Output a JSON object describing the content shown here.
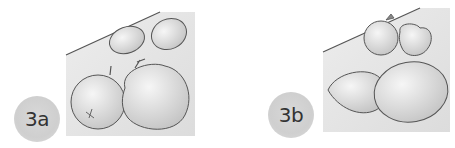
{
  "figures": [
    {
      "label": "3a",
      "description": "Two lemons behind two apples on a table",
      "items": [
        "lemon",
        "lemon",
        "apple",
        "apple"
      ]
    },
    {
      "label": "3b",
      "description": "Two small fruits (apple and peach) behind two lemons on a table",
      "items": [
        "apple",
        "peach",
        "lemon",
        "lemon"
      ]
    }
  ],
  "colors": {
    "badge": "#d0d0d0",
    "background_shade": "#e8e8e8",
    "outline": "#555555"
  }
}
